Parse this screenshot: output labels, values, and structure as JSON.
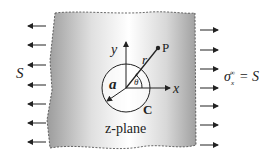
{
  "diagram": {
    "left_load_label": "S",
    "right_load_label": "σ",
    "right_load_sub": "x",
    "right_load_sup": "∞",
    "right_load_eq": "= S",
    "axis_x": "x",
    "axis_y": "y",
    "radius_label": "a",
    "r_label": "r",
    "theta_label": "θ",
    "point_label": "P",
    "contour_label": "C",
    "plane_label": "z-plane",
    "left_arrow_count": 7,
    "right_arrow_count": 7
  },
  "colors": {
    "plate_center": "#ffffff",
    "plate_edge": "#9a9a9a",
    "ink": "#222222"
  }
}
